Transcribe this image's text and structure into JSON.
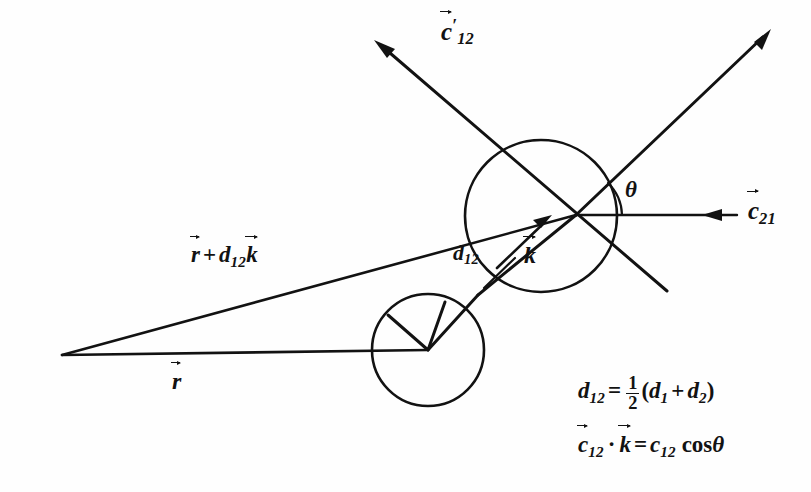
{
  "figure": {
    "background_color": "#fefefe",
    "ink_color": "#121212",
    "width": 811,
    "height": 492
  },
  "labels": {
    "c12_prime": {
      "base": "c",
      "prime": "′",
      "subscript": "12",
      "vector": true
    },
    "c21": {
      "base": "c",
      "subscript": "21",
      "vector": true
    },
    "theta": "θ",
    "d12": {
      "base": "d",
      "subscript": "12",
      "vector": false
    },
    "k_vector": {
      "base": "k",
      "vector": true
    },
    "r_plus_d12_k": {
      "r": "r",
      "plus": "+",
      "d": "d",
      "d_sub": "12",
      "k": "k"
    },
    "r_vector": {
      "base": "r",
      "vector": true
    }
  },
  "equations": {
    "d12_definition": {
      "lhs_base": "d",
      "lhs_sub": "12",
      "equals": "=",
      "frac_num": "1",
      "frac_den": "2",
      "open": "(",
      "term1_base": "d",
      "term1_sub": "1",
      "plus": "+",
      "term2_base": "d",
      "term2_sub": "2",
      "close": ")"
    },
    "dot_product": {
      "lhs_base": "c",
      "lhs_sub": "12",
      "dot": "·",
      "k": "k",
      "equals": "=",
      "rhs_base": "c",
      "rhs_sub": "12",
      "cos": "cos",
      "theta": "θ"
    }
  },
  "geometry": {
    "big_circle": {
      "cx": 541,
      "cy": 216,
      "r": 76,
      "name": "sphere-1"
    },
    "small_circle": {
      "cx": 428,
      "cy": 350,
      "r": 56,
      "name": "sphere-2"
    },
    "contact_point": {
      "x": 478,
      "y": 295
    },
    "apex_point": {
      "x": 62,
      "y": 355
    },
    "center_node": {
      "x": 576,
      "y": 215
    },
    "theta_arc_radius": 46
  }
}
